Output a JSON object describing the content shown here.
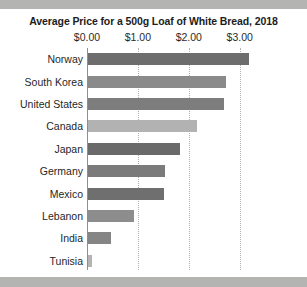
{
  "chart_data": {
    "type": "bar",
    "orientation": "horizontal",
    "title": "Average Price for a 500g Loaf of White Bread, 2018",
    "xlabel": "",
    "ylabel": "",
    "xlim": [
      0,
      3.3
    ],
    "grid": true,
    "legend": "none",
    "tick_labels": [
      "$0.00",
      "$1.00",
      "$2.00",
      "$3.00"
    ],
    "tick_values": [
      0,
      1,
      2,
      3
    ],
    "categories": [
      "Norway",
      "South Korea",
      "United States",
      "Canada",
      "Japan",
      "Germany",
      "Mexico",
      "Lebanon",
      "India",
      "Tunisia"
    ],
    "values": [
      3.17,
      2.71,
      2.67,
      2.15,
      1.8,
      1.52,
      1.5,
      0.91,
      0.46,
      0.08
    ],
    "bar_colors": [
      "#6d6d6d",
      "#8a8a8a",
      "#7d7d7d",
      "#b2b2b2",
      "#6a6a6a",
      "#7b7b7b",
      "#6f6f6f",
      "#8d8d8d",
      "#858585",
      "#b4b4b4"
    ]
  },
  "page": {
    "background": "#ffffff",
    "edge_color": "#b4b4b4",
    "axis_color": "#8e8e8e",
    "grid_color": "#b0b0b0"
  }
}
